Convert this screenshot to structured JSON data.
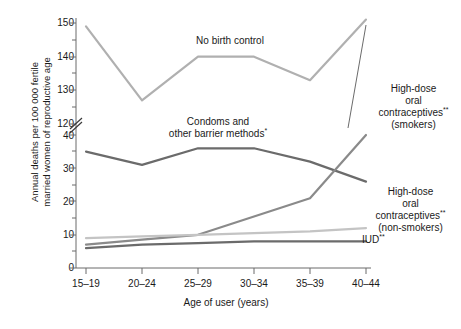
{
  "chart_data": {
    "type": "line",
    "title": "",
    "xlabel": "Age of user (years)",
    "ylabel": "Annual deaths per 100 000 fertile married women of reproductive age",
    "categories": [
      "15–19",
      "20–24",
      "25–29",
      "30–34",
      "35–39",
      "40–44"
    ],
    "ytick_labels_lower": [
      "0",
      "10",
      "20",
      "30",
      "40"
    ],
    "ytick_labels_upper": [
      "120",
      "130",
      "140",
      "150"
    ],
    "ylim_lower": [
      0,
      40
    ],
    "ylim_upper": [
      118,
      152
    ],
    "axis_break": true,
    "grid": false,
    "legend_position": "inline-annotations",
    "series": [
      {
        "name": "No birth control",
        "color": "#b0b0b0",
        "values": [
          149,
          127,
          140,
          140,
          133,
          151
        ]
      },
      {
        "name": "Condoms and other barrier methods*",
        "color": "#6b6b6b",
        "values": [
          35,
          31,
          36,
          36,
          32,
          26
        ]
      },
      {
        "name": "High-dose oral contraceptives** (smokers)",
        "color": "#8a8a8a",
        "values": [
          7,
          8.5,
          10,
          15.5,
          21,
          40
        ]
      },
      {
        "name": "High-dose oral contraceptives** (non-smokers)",
        "color": "#c4c4c4",
        "values": [
          9,
          9.5,
          10,
          10.5,
          11,
          12
        ]
      },
      {
        "name": "IUD**",
        "color": "#6b6b6b",
        "values": [
          6,
          7,
          7.5,
          8,
          8,
          8
        ]
      }
    ]
  },
  "annotations": {
    "no_birth_control": "No birth control",
    "condoms_line1": "Condoms and",
    "condoms_line2": "other barrier methods",
    "condoms_marker": "*",
    "smokers_line1": "High-dose",
    "smokers_line2": "oral",
    "smokers_line3": "contraceptives",
    "smokers_marker": "**",
    "smokers_line4": "(smokers)",
    "nonsmokers_line1": "High-dose",
    "nonsmokers_line2": "oral",
    "nonsmokers_line3": "contraceptives",
    "nonsmokers_marker": "**",
    "nonsmokers_line4": "(non-smokers)",
    "iud_label": "IUD",
    "iud_marker": "**"
  },
  "axis": {
    "y_title": "Annual deaths per 100 000 fertile",
    "y_title2": "married women of reproductive age",
    "x_title": "Age of user (years)"
  }
}
